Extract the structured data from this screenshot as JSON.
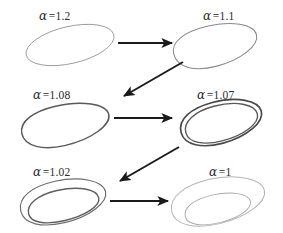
{
  "figure": {
    "background_color": "#ffffff",
    "arrow_color": "#1a1a1a",
    "panels": [
      {
        "id": "alpha-1-2",
        "symbol": "α",
        "equals": "=",
        "value": "1.2",
        "label": "α =1.2",
        "curve_kind": "single-ellipse",
        "loops": 1,
        "stroke_color": "#9a9a9a",
        "stroke_width": 0.9,
        "row": 1,
        "column": 1
      },
      {
        "id": "alpha-1-1",
        "symbol": "α",
        "equals": "=",
        "value": "1.1",
        "label": "α =1.1",
        "curve_kind": "single-ellipse",
        "loops": 1,
        "stroke_color": "#8a8a8a",
        "stroke_width": 1.0,
        "row": 1,
        "column": 2
      },
      {
        "id": "alpha-1-08",
        "symbol": "α",
        "equals": "=",
        "value": "1.08",
        "label": "α =1.08",
        "curve_kind": "single-ellipse",
        "loops": 1,
        "stroke_color": "#5a5a5a",
        "stroke_width": 1.5,
        "row": 2,
        "column": 1
      },
      {
        "id": "alpha-1-07",
        "symbol": "α",
        "equals": "=",
        "value": "1.07",
        "label": "α =1.07",
        "curve_kind": "double-loop-tight",
        "loops": 2,
        "stroke_color": "#4a4a4a",
        "stroke_width": 1.6,
        "row": 2,
        "column": 2
      },
      {
        "id": "alpha-1-02",
        "symbol": "α",
        "equals": "=",
        "value": "1.02",
        "label": "α =1.02",
        "curve_kind": "double-loop-wide",
        "loops": 2,
        "stroke_color": "#666666",
        "stroke_width": 1.2,
        "row": 3,
        "column": 1
      },
      {
        "id": "alpha-1",
        "symbol": "α",
        "equals": "=",
        "value": "1",
        "label": "α =1",
        "curve_kind": "spiral-wide",
        "loops": 2,
        "stroke_color": "#b0b0b0",
        "stroke_width": 0.9,
        "row": 3,
        "column": 2
      }
    ],
    "arrows": [
      {
        "id": "arrow-row1-right",
        "direction": "right",
        "from_panel": "alpha-1-2",
        "to_panel": "alpha-1-1"
      },
      {
        "id": "arrow-row1-to-row2",
        "direction": "down-left",
        "from_panel": "alpha-1-1",
        "to_panel": "alpha-1-08"
      },
      {
        "id": "arrow-row2-right",
        "direction": "right",
        "from_panel": "alpha-1-08",
        "to_panel": "alpha-1-07"
      },
      {
        "id": "arrow-row2-to-row3",
        "direction": "down-left",
        "from_panel": "alpha-1-07",
        "to_panel": "alpha-1-02"
      },
      {
        "id": "arrow-row3-right",
        "direction": "right",
        "from_panel": "alpha-1-02",
        "to_panel": "alpha-1"
      }
    ]
  }
}
